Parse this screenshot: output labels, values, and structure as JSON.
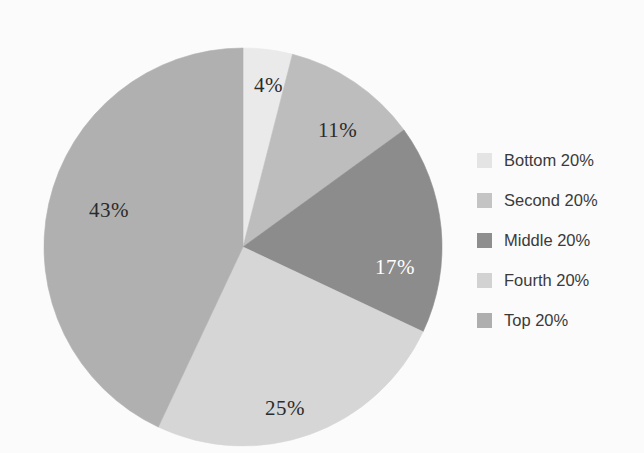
{
  "chart_data": {
    "type": "pie",
    "title": "",
    "subtitle": "",
    "xlabel": "",
    "ylabel": "",
    "grid": false,
    "legend_position": "right",
    "start_angle_deg": 0,
    "direction": "clockwise",
    "categories": [
      "Bottom 20%",
      "Second 20%",
      "Middle 20%",
      "Fourth 20%",
      "Top 20%"
    ],
    "values": [
      4,
      11,
      17,
      25,
      43
    ],
    "value_unit": "%",
    "data_labels": [
      "4%",
      "11%",
      "17%",
      "25%",
      "43%"
    ],
    "slice_colors": [
      "#eaeaea",
      "#bdbdbd",
      "#8c8c8c",
      "#d6d6d6",
      "#b0b0b0"
    ],
    "label_text_colors": [
      "#2b2b2b",
      "#2b2b2b",
      "#ffffff",
      "#2b2b2b",
      "#2b2b2b"
    ],
    "slices": [
      {
        "label": "Bottom 20%",
        "value": 4,
        "data_label": "4%",
        "color": "#eaeaea",
        "label_color": "#2b2b2b",
        "start_deg": 0,
        "end_deg": 14.4,
        "label_x": 211,
        "label_y": 30
      },
      {
        "label": "Second 20%",
        "value": 11,
        "data_label": "11%",
        "color": "#bdbdbd",
        "label_color": "#2b2b2b",
        "start_deg": 14.4,
        "end_deg": 54,
        "label_x": 275,
        "label_y": 75
      },
      {
        "label": "Middle 20%",
        "value": 17,
        "data_label": "17%",
        "color": "#8c8c8c",
        "label_color": "#ffffff",
        "start_deg": 54,
        "end_deg": 115.2,
        "label_x": 332,
        "label_y": 212
      },
      {
        "label": "Fourth 20%",
        "value": 25,
        "data_label": "25%",
        "color": "#d6d6d6",
        "label_color": "#2b2b2b",
        "start_deg": 115.2,
        "end_deg": 205.2,
        "label_x": 222,
        "label_y": 353
      },
      {
        "label": "Top 20%",
        "value": 43,
        "data_label": "43%",
        "color": "#b0b0b0",
        "label_color": "#2b2b2b",
        "start_deg": 205.2,
        "end_deg": 360,
        "label_x": 46,
        "label_y": 155
      }
    ]
  },
  "legend": {
    "items": [
      {
        "label": "Bottom 20%",
        "color": "#e4e4e4"
      },
      {
        "label": "Second 20%",
        "color": "#c4c4c4"
      },
      {
        "label": "Middle 20%",
        "color": "#8e8e8e"
      },
      {
        "label": "Fourth 20%",
        "color": "#d2d2d2"
      },
      {
        "label": "Top 20%",
        "color": "#aeaeae"
      }
    ]
  },
  "colors": {
    "background": "#fbfbfb",
    "label_dark": "#2b2b2b",
    "label_light": "#ffffff",
    "legend_text": "#3a3a3a"
  }
}
